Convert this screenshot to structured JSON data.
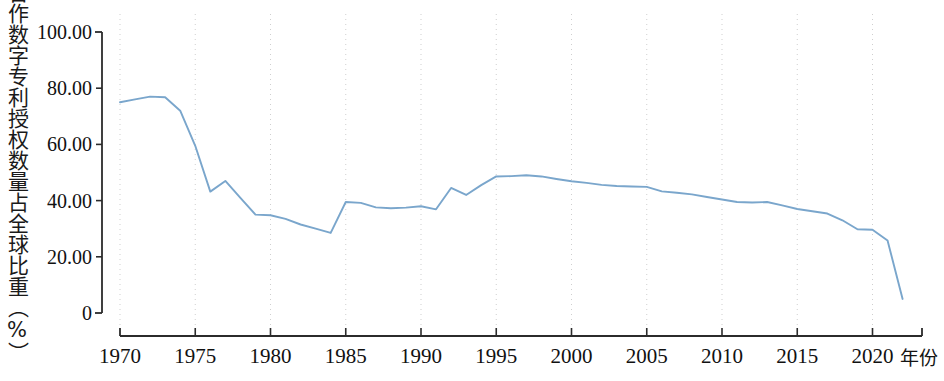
{
  "chart_data": {
    "type": "line",
    "title": "",
    "xlabel": "年份",
    "ylabel": "合作数字专利授权数量占全球比重（%）",
    "xlim": [
      1970,
      2022
    ],
    "ylim": [
      0,
      100
    ],
    "grid": "vertical-dotted",
    "legend": "none",
    "line_color": "#7aa6cc",
    "x_tick_labels": [
      "1970",
      "1975",
      "1980",
      "1985",
      "1990",
      "1995",
      "2000",
      "2005",
      "2010",
      "2015",
      "2020"
    ],
    "x_ticks": [
      1970,
      1975,
      1980,
      1985,
      1990,
      1995,
      2000,
      2005,
      2010,
      2015,
      2020
    ],
    "y_tick_labels": [
      "0",
      "20.00",
      "40.00",
      "60.00",
      "80.00",
      "100.00"
    ],
    "y_ticks": [
      0,
      20,
      40,
      60,
      80,
      100
    ],
    "x": [
      1970,
      1971,
      1972,
      1973,
      1974,
      1975,
      1976,
      1977,
      1978,
      1979,
      1980,
      1981,
      1982,
      1983,
      1984,
      1985,
      1986,
      1987,
      1988,
      1989,
      1990,
      1991,
      1992,
      1993,
      1994,
      1995,
      1996,
      1997,
      1998,
      1999,
      2000,
      2001,
      2002,
      2003,
      2004,
      2005,
      2006,
      2007,
      2008,
      2009,
      2010,
      2011,
      2012,
      2013,
      2014,
      2015,
      2016,
      2017,
      2018,
      2019,
      2020,
      2021,
      2022
    ],
    "values": [
      75.0,
      76.0,
      77.0,
      76.8,
      72.0,
      59.5,
      43.2,
      47.0,
      41.0,
      35.0,
      34.8,
      33.5,
      31.5,
      30.0,
      28.5,
      39.5,
      39.2,
      37.6,
      37.3,
      37.5,
      38.0,
      36.9,
      44.5,
      42.0,
      45.5,
      48.6,
      48.7,
      49.0,
      48.6,
      47.7,
      46.9,
      46.3,
      45.6,
      45.2,
      45.0,
      44.9,
      43.3,
      42.8,
      42.2,
      41.3,
      40.4,
      39.5,
      39.3,
      39.5,
      38.3,
      37.0,
      36.2,
      35.4,
      33.0,
      29.8,
      29.6,
      25.8,
      5.0
    ],
    "series": [
      {
        "name": "合作数字专利授权数量占全球比重",
        "values": [
          75.0,
          76.0,
          77.0,
          76.8,
          72.0,
          59.5,
          43.2,
          47.0,
          41.0,
          35.0,
          34.8,
          33.5,
          31.5,
          30.0,
          28.5,
          39.5,
          39.2,
          37.6,
          37.3,
          37.5,
          38.0,
          36.9,
          44.5,
          42.0,
          45.5,
          48.6,
          48.7,
          49.0,
          48.6,
          47.7,
          46.9,
          46.3,
          45.6,
          45.2,
          45.0,
          44.9,
          43.3,
          42.8,
          42.2,
          41.3,
          40.4,
          39.5,
          39.3,
          39.5,
          38.3,
          37.0,
          36.2,
          35.4,
          33.0,
          29.8,
          29.6,
          25.8,
          5.0
        ]
      }
    ]
  },
  "axes": {
    "y_axis_label": "合作数字专利授权数量占全球比重（%）",
    "x_axis_label": "年份"
  }
}
